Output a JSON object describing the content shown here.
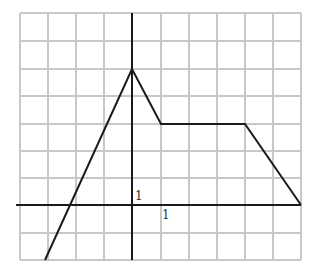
{
  "chart_data": {
    "type": "line",
    "title": "",
    "xlabel": "",
    "ylabel": "",
    "grid": true,
    "xlim": [
      -4,
      6
    ],
    "ylim": [
      -2,
      7
    ],
    "tick_labels": {
      "x_unit": "1",
      "y_unit": "1"
    },
    "series": [
      {
        "name": "piecewise",
        "points": [
          [
            -3,
            -2
          ],
          [
            0,
            5
          ],
          [
            1,
            3
          ],
          [
            4,
            3
          ],
          [
            6,
            0
          ]
        ]
      }
    ],
    "colors": {
      "grid": "#c8c8c8",
      "axis": "#1a1a1a",
      "line": "#1a1a1a"
    }
  },
  "layout": {
    "origin_px": [
      132,
      205
    ],
    "cell_px": [
      16.9,
      27.1
    ],
    "grid_left": 20,
    "grid_right": 301,
    "grid_top": 13,
    "grid_bottom": 260
  }
}
